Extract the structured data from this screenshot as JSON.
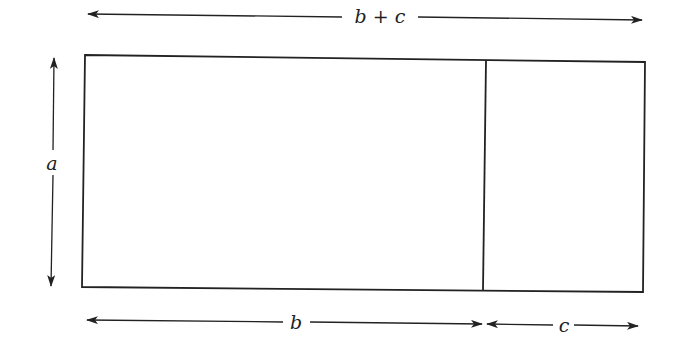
{
  "diagram": {
    "labels": {
      "total_width": "b + c",
      "height": "a",
      "left_width": "b",
      "right_width": "c"
    },
    "colors": {
      "stroke": "#222222",
      "background": "#ffffff"
    }
  }
}
